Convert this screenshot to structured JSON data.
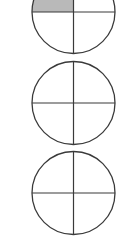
{
  "diagram": {
    "type": "fraction-circles",
    "colors": {
      "stroke": "#3a3a3a",
      "shade": "#b9b9b9",
      "background": "#ffffff"
    },
    "circles": [
      {
        "id": 1,
        "cx": 73.5,
        "cy": 12,
        "r": 41.5,
        "parts": 4,
        "shaded_quarters": [
          "top-left"
        ]
      },
      {
        "id": 2,
        "cx": 73.5,
        "cy": 103,
        "r": 41.5,
        "parts": 4,
        "shaded_quarters": []
      },
      {
        "id": 3,
        "cx": 73.5,
        "cy": 193,
        "r": 41.5,
        "parts": 4,
        "shaded_quarters": []
      }
    ]
  }
}
